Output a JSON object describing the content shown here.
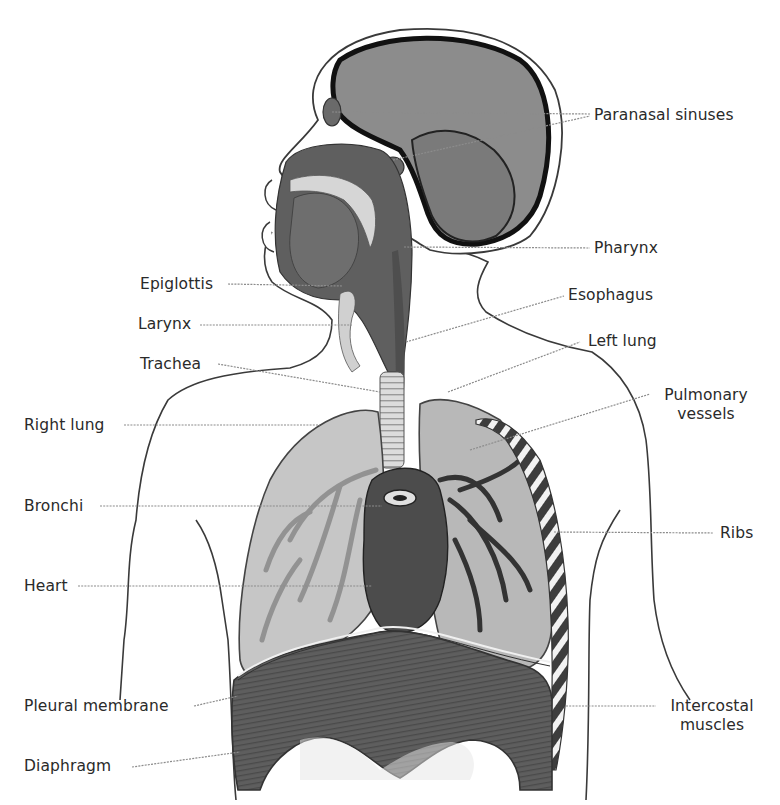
{
  "diagram": {
    "style": "grayscale anatomical illustration",
    "colors": {
      "background": "#ffffff",
      "outline": "#3a3a3a",
      "tissue_dark": "#5a5a5a",
      "tissue_mid": "#8a8a8a",
      "tissue_light": "#c8c8c8",
      "bone_light": "#eeeeee",
      "leader_line": "#8c8c8c",
      "label_text": "#2a2a2a"
    },
    "labels_left": [
      {
        "id": "epiglottis",
        "text": "Epiglottis"
      },
      {
        "id": "larynx",
        "text": "Larynx"
      },
      {
        "id": "trachea",
        "text": "Trachea"
      },
      {
        "id": "right-lung",
        "text": "Right lung"
      },
      {
        "id": "bronchi",
        "text": "Bronchi"
      },
      {
        "id": "heart",
        "text": "Heart"
      },
      {
        "id": "pleural-membrane",
        "text": "Pleural membrane"
      },
      {
        "id": "diaphragm",
        "text": "Diaphragm"
      }
    ],
    "labels_right": [
      {
        "id": "paranasal-sinuses",
        "text": "Paranasal sinuses"
      },
      {
        "id": "pharynx",
        "text": "Pharynx"
      },
      {
        "id": "esophagus",
        "text": "Esophagus"
      },
      {
        "id": "left-lung",
        "text": "Left lung"
      },
      {
        "id": "pulmonary-vessels",
        "line1": "Pulmonary",
        "line2": "vessels"
      },
      {
        "id": "ribs",
        "text": "Ribs"
      },
      {
        "id": "intercostal-muscles",
        "line1": "Intercostal",
        "line2": "muscles"
      }
    ]
  }
}
